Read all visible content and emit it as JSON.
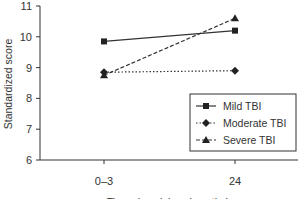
{
  "chart_data": {
    "type": "line",
    "title": "",
    "xlabel": "Time since injury (months)",
    "ylabel": "Standardized score",
    "categories": [
      "0–3",
      "24"
    ],
    "ylim": [
      6,
      11
    ],
    "yticks": [
      6,
      7,
      8,
      9,
      10,
      11
    ],
    "grid": false,
    "legend_position": "lower right",
    "series": [
      {
        "name": "Mild TBI",
        "values": [
          9.85,
          10.2
        ],
        "line_style": "solid",
        "marker": "square"
      },
      {
        "name": "Moderate TBI",
        "values": [
          8.85,
          8.9
        ],
        "line_style": "dotted",
        "marker": "diamond"
      },
      {
        "name": "Severe TBI",
        "values": [
          8.75,
          10.6
        ],
        "line_style": "dashed",
        "marker": "triangle"
      }
    ]
  }
}
